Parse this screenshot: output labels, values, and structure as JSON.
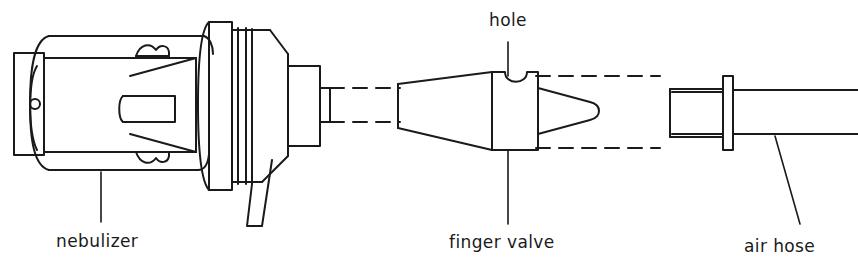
{
  "figure": {
    "type": "line-drawing",
    "background_color": "#ffffff",
    "stroke_color": "#1a1a1a",
    "width": 858,
    "height": 270
  },
  "labels": {
    "nebulizer": "nebulizer",
    "hole": "hole",
    "finger_valve": "finger valve",
    "air_hose": "air hose"
  },
  "parts": [
    {
      "name": "nebulizer",
      "label": "nebulizer",
      "description": "Cylindrical body with end cap, tapered nose, ribbed collar and outlet nozzle",
      "position": "left"
    },
    {
      "name": "finger-valve",
      "label": "finger valve",
      "description": "Tapered sleeve with rectangular valve block having a semicircular hole on top and a conical tip",
      "position": "center"
    },
    {
      "name": "air-hose",
      "label": "air hose",
      "description": "Hose with connector ferrule and flange collar",
      "position": "right"
    }
  ],
  "annotations": {
    "hole_target": "semicircular notch on top of finger valve block",
    "alignment_lines": "dashed construction lines connecting nebulizer outlet to finger valve"
  }
}
